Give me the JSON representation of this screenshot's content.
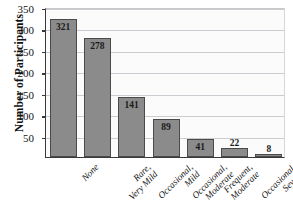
{
  "chart_data": {
    "type": "bar",
    "title": "",
    "xlabel": "",
    "ylabel": "Number of Participants",
    "ylim": [
      0,
      350
    ],
    "yticks": [
      0,
      50,
      100,
      150,
      200,
      250,
      300,
      350
    ],
    "ytick_labels": [
      "",
      "50",
      "100",
      "150",
      "200",
      "250",
      "300",
      "350"
    ],
    "grid": true,
    "legend": "none",
    "categories": [
      "None",
      "Rare, Very Mild",
      "Occasional, Mild",
      "Occasional, Moderate",
      "Frequent, Moderate",
      "Occasional, Severe",
      "Frequent, Severe"
    ],
    "category_lines": [
      [
        "None"
      ],
      [
        "Rare,",
        "Very Mild"
      ],
      [
        "Occasional,",
        "Mild"
      ],
      [
        "Occasional,",
        "Moderate"
      ],
      [
        "Frequent,",
        "Moderate"
      ],
      [
        "Occasional,",
        "Severe"
      ],
      [
        "Frequent,",
        "Severe"
      ]
    ],
    "values": [
      321,
      278,
      141,
      89,
      41,
      22,
      8
    ],
    "value_labels": [
      "321",
      "278",
      "141",
      "89",
      "41",
      "22",
      "8"
    ],
    "label_placement": [
      "inside",
      "inside",
      "inside",
      "inside",
      "inside",
      "above",
      "above"
    ],
    "colors": {
      "bar_fill": "#8b8b8b",
      "bar_edge": "#4a4a4a",
      "gridline": "#c9cdd1",
      "axis": "#3a3a3a",
      "plot_background": "#fbfbfb",
      "text": "#131313"
    }
  }
}
